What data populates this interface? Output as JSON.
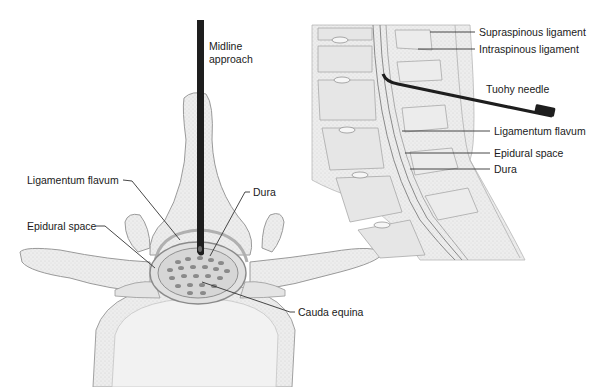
{
  "left_view": {
    "title": "Axial view - midline approach",
    "labels": {
      "midline_line1": "Midline",
      "midline_line2": "approach",
      "ligamentum_flavum": "Ligamentum flavum",
      "dura": "Dura",
      "epidural_space": "Epidural space",
      "cauda_equina": "Cauda equina"
    }
  },
  "right_view": {
    "title": "Sagittal view - lumbar spine",
    "labels": {
      "supraspinous": "Supraspinous ligament",
      "intraspinous": "Intraspinous ligament",
      "tuohy": "Tuohy needle",
      "ligamentum_flavum": "Ligamentum flavum",
      "epidural_space": "Epidural space",
      "dura": "Dura"
    }
  },
  "colors": {
    "bone": "#ececec",
    "bone_stroke": "#9a9a9a",
    "needle": "#1e1e1e",
    "nerve_dots": "#8a8a8a",
    "leader": "#333333"
  }
}
